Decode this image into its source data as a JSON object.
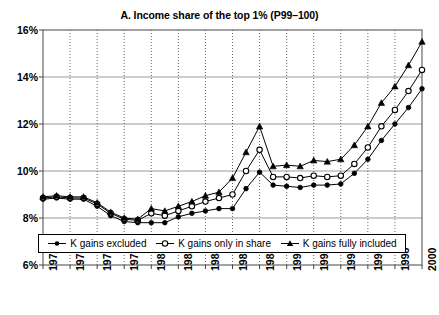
{
  "chart_data": {
    "type": "line",
    "title": "A. Income share of the top 1% (P99–100)",
    "xlabel": "",
    "ylabel": "",
    "xlim": [
      1972,
      2000
    ],
    "ylim": [
      6,
      16
    ],
    "ytick_labels": [
      "16%",
      "14%",
      "12%",
      "10%",
      "8%",
      "6%"
    ],
    "ytick_values": [
      16,
      14,
      12,
      10,
      8,
      6
    ],
    "xtick_labels": [
      "1972",
      "1974",
      "1976",
      "1978",
      "1980",
      "1982",
      "1984",
      "1986",
      "1988",
      "1990",
      "1992",
      "1994",
      "1996",
      "1998",
      "2000"
    ],
    "xtick_values": [
      1972,
      1974,
      1976,
      1978,
      1980,
      1982,
      1984,
      1986,
      1988,
      1990,
      1992,
      1994,
      1996,
      1998,
      2000
    ],
    "grid": "both",
    "legend_position": "bottom-inside",
    "x": [
      1972,
      1973,
      1974,
      1975,
      1976,
      1977,
      1978,
      1979,
      1980,
      1981,
      1982,
      1983,
      1984,
      1985,
      1986,
      1987,
      1988,
      1989,
      1990,
      1991,
      1992,
      1993,
      1994,
      1995,
      1996,
      1997,
      1998,
      1999,
      2000
    ],
    "series": [
      {
        "name": "K gains excluded",
        "marker": "filled-circle",
        "values": [
          8.8,
          8.85,
          8.8,
          8.8,
          8.5,
          8.1,
          7.85,
          7.8,
          7.8,
          7.8,
          8.05,
          8.2,
          8.3,
          8.4,
          8.4,
          9.25,
          9.95,
          9.4,
          9.35,
          9.3,
          9.4,
          9.4,
          9.45,
          9.9,
          10.5,
          11.3,
          12.0,
          12.7,
          13.5
        ]
      },
      {
        "name": "K gains only in share",
        "marker": "open-circle",
        "values": [
          8.85,
          8.9,
          8.85,
          8.85,
          8.6,
          8.2,
          7.95,
          7.9,
          8.2,
          8.1,
          8.3,
          8.5,
          8.7,
          8.85,
          9.0,
          10.0,
          10.9,
          9.75,
          9.75,
          9.7,
          9.8,
          9.75,
          9.8,
          10.3,
          11.0,
          11.9,
          12.6,
          13.4,
          14.3
        ]
      },
      {
        "name": "K gains fully included",
        "marker": "filled-triangle",
        "values": [
          8.9,
          8.95,
          8.9,
          8.9,
          8.65,
          8.25,
          8.0,
          7.95,
          8.4,
          8.3,
          8.5,
          8.7,
          8.95,
          9.1,
          9.7,
          10.8,
          11.9,
          10.2,
          10.25,
          10.2,
          10.45,
          10.4,
          10.5,
          11.1,
          11.9,
          12.9,
          13.6,
          14.5,
          15.5
        ]
      }
    ]
  },
  "legend": {
    "items": [
      {
        "label": "K gains excluded",
        "marker": "filled-circle"
      },
      {
        "label": "K gains only in share",
        "marker": "open-circle"
      },
      {
        "label": "K gains fully included",
        "marker": "filled-triangle"
      }
    ]
  },
  "colors": {
    "line": "#000000",
    "grid": "#808080",
    "vgrid": "#555555",
    "frame": "#666666",
    "background": "#ffffff"
  }
}
